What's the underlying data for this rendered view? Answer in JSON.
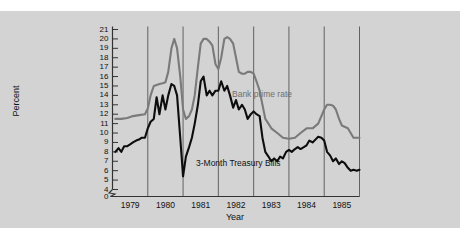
{
  "chart_data": {
    "type": "line",
    "title": "",
    "subtitle": "",
    "xlabel": "Year",
    "ylabel": "Percent",
    "grid": "vertical-year-boundaries",
    "legend_position": "inline-annotations",
    "axis_break": true,
    "xlim": [
      1978.5,
      1985.5
    ],
    "ylim": [
      4,
      21
    ],
    "y_ticks": [
      0,
      4,
      5,
      6,
      7,
      8,
      9,
      10,
      11,
      12,
      13,
      14,
      15,
      16,
      17,
      18,
      19,
      20,
      21
    ],
    "y_tick_labels": [
      "0",
      "4",
      "5",
      "6",
      "7",
      "8",
      "9",
      "10",
      "11",
      "12",
      "13",
      "14",
      "15",
      "16",
      "17",
      "18",
      "19",
      "20",
      "21"
    ],
    "x_ticks": [
      1979,
      1980,
      1981,
      1982,
      1983,
      1984,
      1985
    ],
    "x_tick_labels": [
      "1979",
      "1980",
      "1981",
      "1982",
      "1983",
      "1984",
      "1985"
    ],
    "gridlines_x": [
      1979.5,
      1980.5,
      1981.5,
      1982.5,
      1983.5,
      1984.5,
      1985.5
    ],
    "colors": {
      "background": "#d3d3d3",
      "figure": "#ffffff",
      "axis": "#333333",
      "gridline": "#555555",
      "bank_prime_rate": "#7a7a7a",
      "treasury_bills": "#0d0d0d"
    },
    "series": [
      {
        "name": "Bank prime rate",
        "color": "#7a7a7a",
        "label_x": 1982.35,
        "label_y": 14.2,
        "x": [
          1978.58,
          1978.75,
          1978.92,
          1979.08,
          1979.25,
          1979.42,
          1979.5,
          1979.58,
          1979.67,
          1979.75,
          1979.83,
          1979.92,
          1980.0,
          1980.08,
          1980.17,
          1980.25,
          1980.33,
          1980.42,
          1980.5,
          1980.58,
          1980.67,
          1980.75,
          1980.83,
          1980.92,
          1981.0,
          1981.08,
          1981.17,
          1981.25,
          1981.33,
          1981.42,
          1981.5,
          1981.58,
          1981.67,
          1981.75,
          1981.83,
          1981.92,
          1982.0,
          1982.08,
          1982.17,
          1982.25,
          1982.33,
          1982.42,
          1982.5,
          1982.58,
          1982.67,
          1982.75,
          1982.83,
          1982.92,
          1983.0,
          1983.17,
          1983.33,
          1983.5,
          1983.67,
          1983.83,
          1984.0,
          1984.08,
          1984.17,
          1984.33,
          1984.5,
          1984.58,
          1984.67,
          1984.75,
          1984.83,
          1984.92,
          1985.0,
          1985.17,
          1985.33,
          1985.5
        ],
        "y": [
          11.5,
          11.5,
          11.6,
          11.8,
          11.9,
          12.0,
          12.6,
          14.0,
          15.0,
          15.1,
          15.2,
          15.3,
          15.4,
          16.5,
          19.0,
          20.0,
          19.0,
          16.0,
          12.5,
          11.5,
          11.8,
          12.5,
          14.0,
          17.0,
          19.5,
          20.0,
          20.0,
          19.7,
          19.3,
          17.3,
          16.8,
          18.0,
          20.0,
          20.2,
          20.0,
          19.5,
          18.0,
          16.5,
          16.3,
          16.3,
          16.5,
          16.5,
          16.3,
          15.5,
          14.5,
          13.0,
          11.5,
          11.0,
          10.5,
          10.0,
          9.5,
          9.4,
          9.5,
          10.0,
          10.5,
          10.5,
          10.5,
          11.0,
          12.5,
          13.0,
          13.0,
          12.9,
          12.5,
          11.5,
          10.8,
          10.5,
          9.5,
          9.5
        ]
      },
      {
        "name": "3-Month Treasury Bills",
        "color": "#0d0d0d",
        "label_x": 1981.4,
        "label_y": 5.5,
        "x": [
          1978.58,
          1978.67,
          1978.75,
          1978.83,
          1978.92,
          1979.0,
          1979.08,
          1979.17,
          1979.25,
          1979.33,
          1979.42,
          1979.5,
          1979.58,
          1979.67,
          1979.75,
          1979.83,
          1979.92,
          1980.0,
          1980.08,
          1980.17,
          1980.25,
          1980.33,
          1980.42,
          1980.5,
          1980.58,
          1980.67,
          1980.75,
          1980.83,
          1980.92,
          1981.0,
          1981.08,
          1981.17,
          1981.25,
          1981.33,
          1981.42,
          1981.5,
          1981.58,
          1981.67,
          1981.75,
          1981.83,
          1981.92,
          1982.0,
          1982.08,
          1982.17,
          1982.25,
          1982.33,
          1982.42,
          1982.5,
          1982.58,
          1982.67,
          1982.75,
          1982.83,
          1982.92,
          1983.0,
          1983.08,
          1983.17,
          1983.25,
          1983.33,
          1983.42,
          1983.5,
          1983.58,
          1983.67,
          1983.75,
          1983.83,
          1983.92,
          1984.0,
          1984.08,
          1984.17,
          1984.25,
          1984.33,
          1984.42,
          1984.5,
          1984.58,
          1984.67,
          1984.75,
          1984.83,
          1984.92,
          1985.0,
          1985.08,
          1985.17,
          1985.25,
          1985.33,
          1985.42,
          1985.5
        ],
        "y": [
          8.0,
          8.4,
          8.0,
          8.6,
          8.6,
          8.8,
          9.0,
          9.2,
          9.3,
          9.5,
          9.5,
          10.5,
          11.2,
          11.5,
          13.8,
          12.0,
          14.0,
          12.5,
          14.0,
          15.2,
          15.0,
          14.0,
          9.5,
          5.4,
          7.5,
          8.5,
          9.5,
          11.0,
          13.0,
          15.5,
          16.0,
          14.0,
          14.5,
          14.0,
          14.5,
          14.5,
          15.5,
          14.5,
          15.0,
          14.0,
          12.7,
          13.5,
          12.5,
          13.0,
          12.5,
          11.5,
          12.0,
          12.3,
          12.0,
          11.8,
          9.5,
          8.0,
          7.5,
          7.0,
          7.3,
          7.0,
          7.5,
          7.3,
          8.0,
          8.2,
          8.0,
          8.3,
          8.5,
          8.3,
          8.5,
          8.7,
          9.2,
          9.0,
          9.3,
          9.6,
          9.5,
          9.2,
          8.0,
          7.6,
          7.0,
          7.3,
          6.7,
          7.0,
          6.8,
          6.3,
          6.0,
          6.1,
          6.0,
          6.1
        ]
      }
    ]
  }
}
